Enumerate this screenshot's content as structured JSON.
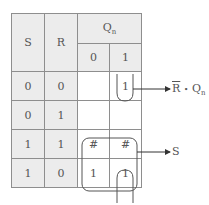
{
  "kmap": {
    "row_var_1": "S",
    "row_var_2": "R",
    "col_var": "Q",
    "col_var_sub": "n",
    "col_headers": [
      "0",
      "1"
    ],
    "rows": [
      {
        "s": "0",
        "r": "0",
        "q0": "",
        "q1": "1"
      },
      {
        "s": "0",
        "r": "1",
        "q0": "",
        "q1": ""
      },
      {
        "s": "1",
        "r": "1",
        "q0": "#",
        "q1": "#"
      },
      {
        "s": "1",
        "r": "0",
        "q0": "1",
        "q1": "1"
      }
    ]
  },
  "groups": [
    {
      "term_main": "R",
      "term_overbar": true,
      "term_dot": "•",
      "term_q": "Q",
      "term_q_sub": "n"
    },
    {
      "term": "S"
    }
  ],
  "colors": {
    "header_fill": "#ececec",
    "cell_fill": "#ffffff",
    "grid_line": "#8e8e8e",
    "loop_stroke": "#555555"
  }
}
